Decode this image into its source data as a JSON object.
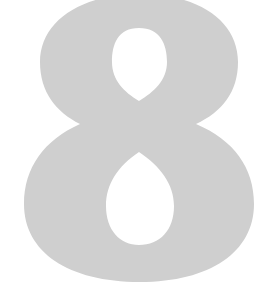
{
  "figure": {
    "glyph": "8",
    "label": "Large gray numeral eight",
    "fill_color": "#cfcfcf",
    "background_color": "#ffffff"
  }
}
